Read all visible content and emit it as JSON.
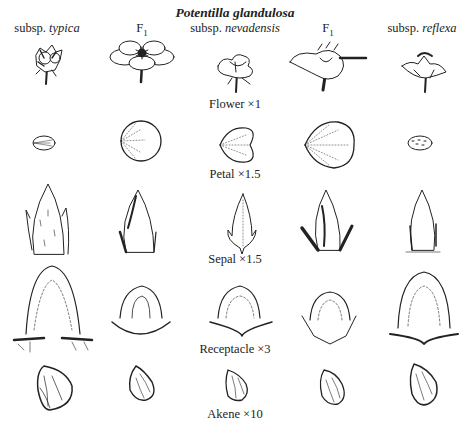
{
  "title": "Potentilla glandulosa",
  "columns": [
    {
      "prefix": "subsp. ",
      "name": "typica",
      "x": 47
    },
    {
      "prefix": "F",
      "sub": "1",
      "name": "",
      "x": 142
    },
    {
      "prefix": "subsp. ",
      "name": "nevadensis",
      "x": 235
    },
    {
      "prefix": "F",
      "sub": "1",
      "name": "",
      "x": 328
    },
    {
      "prefix": "subsp. ",
      "name": "reflexa",
      "x": 422
    }
  ],
  "rows": [
    {
      "label": "Flower ×1",
      "label_y": 97
    },
    {
      "label": "Petal ×1.5",
      "label_y": 167
    },
    {
      "label": "Sepal ×1.5",
      "label_y": 252
    },
    {
      "label": "Receptacle ×3",
      "label_y": 342
    },
    {
      "label": "Akene ×10",
      "label_y": 407
    }
  ],
  "figure_type": "botanical line-drawing comparison plate",
  "ink_color": "#222222",
  "background_color": "#ffffff"
}
